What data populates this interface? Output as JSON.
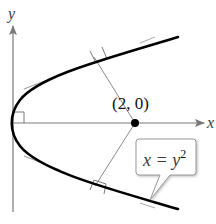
{
  "diagram": {
    "type": "math-figure",
    "axes": {
      "x_label": "x",
      "y_label": "y"
    },
    "point": {
      "label": "(2, 0)",
      "coords": [
        2,
        0
      ]
    },
    "curve": {
      "equation_lhs": "x = y",
      "equation_exponent": "2"
    },
    "colors": {
      "curve": "#000000",
      "axis": "#7a7a7a",
      "tangent": "#9a9a9a",
      "normal": "#8a8a8a",
      "callout_border": "#9a9a9a"
    }
  }
}
